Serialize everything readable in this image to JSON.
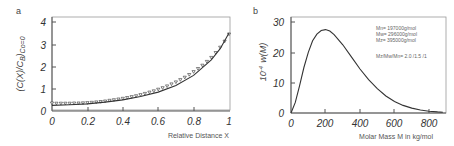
{
  "chart_data": [
    {
      "panel": "a",
      "type": "scatter",
      "title": "",
      "xlabel": "Relative Distance  X",
      "ylabel": "(C(X)/C_B)_Co=0",
      "xlim": [
        0,
        1
      ],
      "ylim": [
        0,
        4.2
      ],
      "xticks": [
        "0",
        "0.2",
        "0.4",
        "0.6",
        "0.8",
        "1"
      ],
      "yticks": [
        "0",
        "1",
        "2",
        "3",
        "4"
      ],
      "grid": false,
      "series": [
        {
          "name": "fit (solid line)",
          "kind": "line",
          "x": [
            0,
            0.1,
            0.2,
            0.3,
            0.4,
            0.5,
            0.6,
            0.7,
            0.8,
            0.9,
            0.95,
            1.0
          ],
          "y": [
            0.25,
            0.28,
            0.32,
            0.4,
            0.5,
            0.65,
            0.85,
            1.15,
            1.6,
            2.3,
            2.8,
            3.5
          ]
        },
        {
          "name": "data (open triangles)",
          "kind": "markers",
          "x": [
            0,
            0.025,
            0.05,
            0.075,
            0.1,
            0.125,
            0.15,
            0.175,
            0.2,
            0.225,
            0.25,
            0.275,
            0.3,
            0.325,
            0.35,
            0.375,
            0.4,
            0.425,
            0.45,
            0.475,
            0.5,
            0.525,
            0.55,
            0.575,
            0.6,
            0.625,
            0.65,
            0.675,
            0.7,
            0.725,
            0.75,
            0.775,
            0.8,
            0.825,
            0.85,
            0.875,
            0.9,
            0.925,
            0.95,
            0.975,
            1.0
          ],
          "y": [
            0.35,
            0.34,
            0.34,
            0.34,
            0.34,
            0.35,
            0.35,
            0.36,
            0.37,
            0.38,
            0.4,
            0.42,
            0.44,
            0.47,
            0.5,
            0.53,
            0.56,
            0.6,
            0.64,
            0.68,
            0.73,
            0.78,
            0.84,
            0.9,
            0.97,
            1.04,
            1.12,
            1.21,
            1.3,
            1.4,
            1.51,
            1.63,
            1.76,
            1.9,
            2.05,
            2.22,
            2.4,
            2.62,
            2.86,
            3.13,
            3.45
          ]
        }
      ],
      "legend": null
    },
    {
      "panel": "b",
      "type": "line",
      "title": "",
      "xlabel": "Molar Mass M in kg/mol",
      "ylabel": "10^-4  w(M)",
      "xlim": [
        0,
        880
      ],
      "ylim": [
        0,
        31
      ],
      "xticks": [
        "0",
        "200",
        "400",
        "600",
        "800"
      ],
      "yticks": [
        "0",
        "10",
        "20",
        "30"
      ],
      "grid": false,
      "series": [
        {
          "name": "w(M)",
          "x": [
            0,
            25,
            50,
            75,
            100,
            125,
            150,
            175,
            200,
            225,
            250,
            300,
            350,
            400,
            450,
            500,
            550,
            600,
            650,
            700,
            750,
            800,
            850,
            880
          ],
          "y": [
            0,
            3.5,
            9,
            15,
            20,
            23.8,
            26,
            27.2,
            27.5,
            27,
            25.8,
            22.5,
            18.5,
            14.5,
            11,
            8,
            5.6,
            3.8,
            2.5,
            1.6,
            1.0,
            0.6,
            0.35,
            0.25
          ]
        }
      ],
      "annotations": [
        "Mn= 197000g/mol",
        "Mw= 296000g/mol",
        "Mz= 395000g/mol",
        "Mz/Mw/Mn= 2.0 /1.5 /1"
      ]
    }
  ],
  "panels": {
    "a": {
      "label": "a",
      "ylabel": "(C(X)/C",
      "ylabel_sub": "B",
      "ylabel_end": ")",
      "ylabel_sub2": "Co=0",
      "xlabel": "Relative Distance  X",
      "yticks": [
        "0",
        "1",
        "2",
        "3",
        "4"
      ],
      "xticks": [
        "0",
        "0.2",
        "0.4",
        "0.6",
        "0.8",
        "1"
      ]
    },
    "b": {
      "label": "b",
      "ylabel_pre": "10",
      "ylabel_exp": "-4",
      "ylabel_main": "w(M)",
      "xlabel": "Molar Mass M in kg/mol",
      "yticks": [
        "0",
        "10",
        "20",
        "30"
      ],
      "xticks": [
        "0",
        "200",
        "400",
        "600",
        "800"
      ],
      "legend": {
        "mn": "Mn= 197000g/mol",
        "mw": "Mw= 296000g/mol",
        "mz": "Mz= 395000g/mol",
        "ratio": "Mz/Mw/Mn= 2.0 /1.5 /1"
      }
    }
  }
}
